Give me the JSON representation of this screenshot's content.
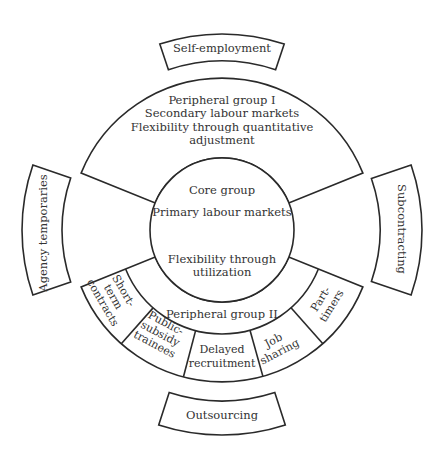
{
  "diagram": {
    "center": {
      "x": 222,
      "y": 230
    },
    "colors": {
      "stroke": "#2a2a2a",
      "text": "#333333",
      "background": "#ffffff"
    },
    "radii": {
      "core": 72,
      "middle": 104,
      "outer": 152
    },
    "core_group": {
      "line1": "Core group",
      "line2": "Primary labour markets",
      "line3": "Flexibility through",
      "line4": "utilization"
    },
    "peripheral_group_1": {
      "line1": "Peripheral group I",
      "line2": "Secondary labour markets",
      "line3": "Flexibility through quantitative",
      "line4": "adjustment"
    },
    "peripheral_group_2": {
      "label": "Peripheral group II",
      "segments": [
        {
          "lines": [
            "Short-",
            "term",
            "contracts"
          ]
        },
        {
          "lines": [
            "Public-",
            "subsidy",
            "trainees"
          ]
        },
        {
          "lines": [
            "Delayed",
            "recruitment"
          ]
        },
        {
          "lines": [
            "Job",
            "sharing"
          ]
        },
        {
          "lines": [
            "Part-",
            "timers"
          ]
        }
      ]
    },
    "external": {
      "top": "Self-employment",
      "left": "Agency temporaries",
      "right": "Subcontracting",
      "bottom": "Outsourcing"
    }
  }
}
